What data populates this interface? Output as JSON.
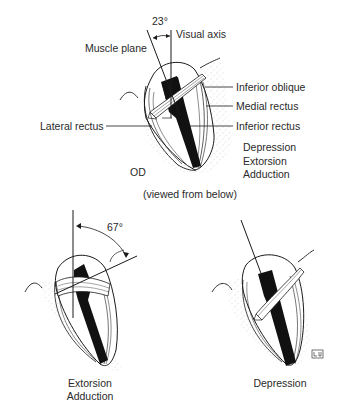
{
  "top_figure": {
    "angle_label": "23°",
    "labels": {
      "muscle_plane": "Muscle plane",
      "visual_axis": "Visual axis",
      "inferior_oblique": "Inferior oblique",
      "medial_rectus": "Medial rectus",
      "lateral_rectus": "Lateral rectus",
      "inferior_rectus": "Inferior rectus",
      "eye_side": "OD"
    },
    "actions": [
      "Depression",
      "Extorsion",
      "Adduction"
    ],
    "caption": "(viewed from below)"
  },
  "bottom_left_figure": {
    "angle_label": "67°",
    "actions": [
      "Extorsion",
      "Adduction"
    ]
  },
  "bottom_right_figure": {
    "actions": [
      "Depression"
    ],
    "signature": "Lu"
  },
  "colors": {
    "ink": "#1a1a1a",
    "muscle_fill": "#111111",
    "stipple": "#9a9a9a",
    "background": "#ffffff"
  }
}
